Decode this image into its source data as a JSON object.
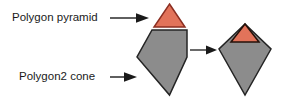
{
  "figure": {
    "background_color": "#ffffff",
    "labels": [
      {
        "id": "pyramid",
        "text": "Polygon pyramid",
        "x": 12,
        "y": 18
      },
      {
        "id": "cone",
        "text": "Polygon2 cone",
        "x": 19,
        "y": 77
      }
    ],
    "callouts": [
      {
        "id": "pyramid-callout",
        "name": "callout-arrow-pyramid",
        "line": "M110,18 L136,18",
        "head": "M136,13.2 L149,18 L136,22.8 Z"
      },
      {
        "id": "cone-callout",
        "name": "callout-arrow-cone",
        "line": "M110,77 L124,77",
        "head": "M124,72.2 L137,77 L124,81.8 Z"
      }
    ],
    "flow_arrow": {
      "name": "transform-arrow",
      "line": "M190,50 L206,50",
      "head": "M206,45.4 L217,50 L206,54.6 Z"
    },
    "shapes": {
      "source_pyramid": {
        "name": "pyramid-triangle",
        "fill": "#e2735a",
        "stroke": "#8c2f22",
        "points": "169.5,4 185,27 154,27"
      },
      "source_cone": {
        "name": "cone-pentagon",
        "fill": "#8c8c8c",
        "stroke": "#242424",
        "points": "152,30 187,30 187,57 169.5,95 137,57"
      },
      "result_cone": {
        "name": "merged-kite-body",
        "fill": "#8c8c8c",
        "stroke": "#242424",
        "points": "245,24 271,49 245,95 219,49"
      },
      "result_pyramid": {
        "name": "merged-kite-cap",
        "fill": "#e2735a",
        "stroke": "#241008",
        "points": "245,24 259,42 231,42"
      }
    },
    "colors": {
      "red_fill": "#e2735a",
      "red_stroke": "#8c2f22",
      "gray_fill": "#8c8c8c",
      "gray_stroke": "#242424",
      "text": "#1a1a1a"
    }
  }
}
